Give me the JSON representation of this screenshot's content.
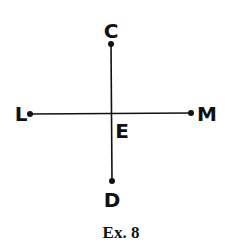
{
  "diagram": {
    "caption": "Ex. 8",
    "points": {
      "C": "C",
      "D": "D",
      "L": "L",
      "M": "M",
      "E": "E"
    },
    "segments": [
      {
        "from": "C",
        "to": "D"
      },
      {
        "from": "L",
        "to": "M"
      }
    ],
    "intersection": "E",
    "colors": {
      "ink": "#111111",
      "background": "#ffffff"
    }
  }
}
